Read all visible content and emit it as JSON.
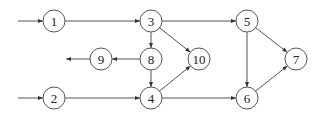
{
  "diagram": {
    "type": "directed-graph",
    "stroke_color": "#555555",
    "node_radius": 11,
    "nodes": [
      {
        "id": "1",
        "label": "1",
        "x": 54,
        "y": 21
      },
      {
        "id": "2",
        "label": "2",
        "x": 54,
        "y": 98
      },
      {
        "id": "3",
        "label": "3",
        "x": 151,
        "y": 21
      },
      {
        "id": "4",
        "label": "4",
        "x": 151,
        "y": 98
      },
      {
        "id": "5",
        "label": "5",
        "x": 247,
        "y": 21
      },
      {
        "id": "6",
        "label": "6",
        "x": 247,
        "y": 98
      },
      {
        "id": "7",
        "label": "7",
        "x": 296,
        "y": 59
      },
      {
        "id": "8",
        "label": "8",
        "x": 151,
        "y": 59
      },
      {
        "id": "9",
        "label": "9",
        "x": 101,
        "y": 59
      },
      {
        "id": "10",
        "label": "10",
        "x": 199,
        "y": 59
      }
    ],
    "edges": [
      {
        "from": "in",
        "to": "1"
      },
      {
        "from": "in",
        "to": "2"
      },
      {
        "from": "1",
        "to": "3"
      },
      {
        "from": "2",
        "to": "4"
      },
      {
        "from": "3",
        "to": "5"
      },
      {
        "from": "3",
        "to": "8"
      },
      {
        "from": "3",
        "to": "10"
      },
      {
        "from": "8",
        "to": "9"
      },
      {
        "from": "8",
        "to": "4"
      },
      {
        "from": "9",
        "to": "out"
      },
      {
        "from": "4",
        "to": "10"
      },
      {
        "from": "4",
        "to": "6"
      },
      {
        "from": "5",
        "to": "6"
      },
      {
        "from": "5",
        "to": "7"
      },
      {
        "from": "6",
        "to": "7"
      }
    ],
    "external_edges": {
      "input_1": {
        "x1": 18,
        "y1": 21,
        "to": "1"
      },
      "input_2": {
        "x1": 18,
        "y1": 98,
        "to": "2"
      },
      "output_9": {
        "from": "9",
        "x2": 66,
        "y2": 59
      }
    }
  }
}
